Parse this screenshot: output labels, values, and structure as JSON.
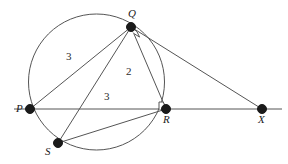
{
  "figure": {
    "width": 288,
    "height": 164,
    "background_color": "#ffffff",
    "stroke_color": "#555555",
    "point_fill_color": "#1a1a1a",
    "label_color": "#1a1a1a"
  },
  "circle": {
    "name": "circumcircle",
    "cx": 96.5,
    "cy": 82,
    "r": 68
  },
  "points": [
    {
      "id": "P",
      "label": "P",
      "x": 30,
      "y": 109,
      "label_x": 16,
      "label_y": 103,
      "radius": 4.5
    },
    {
      "id": "Q",
      "label": "Q",
      "x": 131,
      "y": 27,
      "label_x": 128,
      "label_y": 8,
      "radius": 4.5
    },
    {
      "id": "R",
      "label": "R",
      "x": 166,
      "y": 109,
      "label_x": 163,
      "label_y": 114,
      "radius": 4.5
    },
    {
      "id": "S",
      "label": "S",
      "x": 58,
      "y": 143,
      "label_x": 45,
      "label_y": 146,
      "radius": 4.5
    },
    {
      "id": "X",
      "label": "X",
      "x": 262,
      "y": 109,
      "label_x": 258,
      "label_y": 114,
      "radius": 4.5
    }
  ],
  "segments": [
    {
      "id": "baseline",
      "from": "P-extended-left",
      "x1": 14,
      "y1": 109,
      "x2": 282,
      "y2": 109
    },
    {
      "id": "PQ",
      "from": "P",
      "to": "Q",
      "x1": 30,
      "y1": 109,
      "x2": 131,
      "y2": 27
    },
    {
      "id": "QR",
      "from": "Q",
      "to": "R",
      "x1": 131,
      "y1": 27,
      "x2": 166,
      "y2": 109
    },
    {
      "id": "QS",
      "from": "Q",
      "to": "S",
      "x1": 131,
      "y1": 27,
      "x2": 58,
      "y2": 143
    },
    {
      "id": "QX",
      "from": "Q",
      "to": "X",
      "x1": 131,
      "y1": 27,
      "x2": 262,
      "y2": 109
    },
    {
      "id": "SR",
      "from": "S",
      "to": "R",
      "x1": 58,
      "y1": 143,
      "x2": 166,
      "y2": 109
    }
  ],
  "right_angle_marks": [
    {
      "id": "angle-at-Q",
      "vertex": "Q",
      "x": 131,
      "y": 27,
      "size": 7,
      "dir1": [
        0.39,
        0.92
      ],
      "dir2": [
        0.85,
        0.53
      ]
    },
    {
      "id": "angle-at-R",
      "vertex": "R",
      "x": 166,
      "y": 109,
      "size": 7,
      "dir1": [
        -1,
        0
      ],
      "dir2": [
        -0.39,
        -0.92
      ]
    }
  ],
  "measures": [
    {
      "id": "measure-PQ",
      "value": "3",
      "x": 66,
      "y": 51
    },
    {
      "id": "measure-QR",
      "value": "2",
      "x": 126,
      "y": 66
    },
    {
      "id": "measure-PR",
      "value": "3",
      "x": 104,
      "y": 91
    }
  ]
}
